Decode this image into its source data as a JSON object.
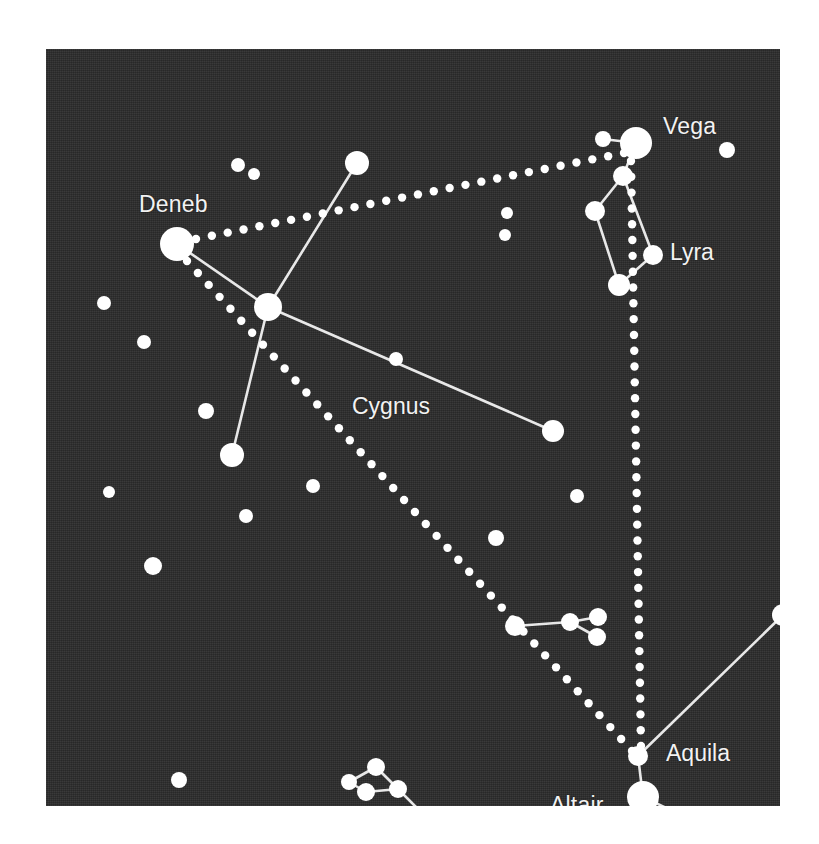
{
  "chart_data": {
    "type": "scatter",
    "xlabel": "",
    "ylabel": "",
    "xlim": [
      0,
      734
    ],
    "ylim": [
      0,
      757
    ],
    "grid": false,
    "legend": "none",
    "background_color": "#2c2c2c",
    "star_color": "#ffffff",
    "line_color": "#e8e8e8",
    "label_color": "#f2f2f2",
    "labels": [
      {
        "id": "label-vega",
        "text": "Vega",
        "x": 617,
        "y": 66,
        "kind": "star"
      },
      {
        "id": "label-deneb",
        "text": "Deneb",
        "x": 93,
        "y": 144,
        "kind": "star"
      },
      {
        "id": "label-lyra",
        "text": "Lyra",
        "x": 624,
        "y": 192,
        "kind": "constellation"
      },
      {
        "id": "label-cygnus",
        "text": "Cygnus",
        "x": 306,
        "y": 346,
        "kind": "constellation"
      },
      {
        "id": "label-aquila",
        "text": "Aquila",
        "x": 620,
        "y": 693,
        "kind": "constellation"
      },
      {
        "id": "label-altair",
        "text": "Altair",
        "x": 504,
        "y": 745,
        "kind": "star"
      }
    ],
    "stars": [
      {
        "name": "vega",
        "x": 590,
        "y": 94,
        "r": 16
      },
      {
        "name": "vega-companion-epsilon",
        "x": 557,
        "y": 90,
        "r": 8
      },
      {
        "name": "lyra-zeta",
        "x": 577,
        "y": 127,
        "r": 10
      },
      {
        "name": "lyra-delta",
        "x": 549,
        "y": 162,
        "r": 10
      },
      {
        "name": "lyra-gamma",
        "x": 607,
        "y": 206,
        "r": 10
      },
      {
        "name": "lyra-beta",
        "x": 573,
        "y": 236,
        "r": 11
      },
      {
        "name": "star-upper-right-edge",
        "x": 681,
        "y": 101,
        "r": 8
      },
      {
        "name": "deneb",
        "x": 131,
        "y": 195,
        "r": 17
      },
      {
        "name": "cygnus-sadr",
        "x": 222,
        "y": 258,
        "r": 14
      },
      {
        "name": "cygnus-delta",
        "x": 311,
        "y": 114,
        "r": 12
      },
      {
        "name": "cygnus-epsilon",
        "x": 507,
        "y": 382,
        "r": 11
      },
      {
        "name": "cygnus-albireo",
        "x": 186,
        "y": 406,
        "r": 12
      },
      {
        "name": "star-top-a",
        "x": 192,
        "y": 116,
        "r": 7
      },
      {
        "name": "star-top-b",
        "x": 208,
        "y": 125,
        "r": 6
      },
      {
        "name": "star-mid-top-a",
        "x": 461,
        "y": 164,
        "r": 6
      },
      {
        "name": "star-mid-top-b",
        "x": 459,
        "y": 186,
        "r": 6
      },
      {
        "name": "star-cygnus-field",
        "x": 350,
        "y": 310,
        "r": 7
      },
      {
        "name": "star-left-edge-a",
        "x": 58,
        "y": 254,
        "r": 7
      },
      {
        "name": "star-left-edge-b",
        "x": 98,
        "y": 293,
        "r": 7
      },
      {
        "name": "star-left-edge-c",
        "x": 160,
        "y": 362,
        "r": 8
      },
      {
        "name": "star-left-edge-d",
        "x": 63,
        "y": 443,
        "r": 6
      },
      {
        "name": "star-left-edge-e",
        "x": 107,
        "y": 517,
        "r": 9
      },
      {
        "name": "star-left-mid",
        "x": 200,
        "y": 467,
        "r": 7
      },
      {
        "name": "star-center-field-a",
        "x": 267,
        "y": 437,
        "r": 7
      },
      {
        "name": "star-center-field-b",
        "x": 450,
        "y": 489,
        "r": 8
      },
      {
        "name": "star-center-field-c",
        "x": 531,
        "y": 447,
        "r": 7
      },
      {
        "name": "star-right-field-a",
        "x": 751,
        "y": 414,
        "r": 9
      },
      {
        "name": "star-right-field-b",
        "x": 771,
        "y": 458,
        "r": 9
      },
      {
        "name": "star-right-field-c",
        "x": 745,
        "y": 537,
        "r": 5
      },
      {
        "name": "aquila-wing-tip",
        "x": 737,
        "y": 566,
        "r": 11
      },
      {
        "name": "sagitta-a",
        "x": 469,
        "y": 577,
        "r": 10
      },
      {
        "name": "sagitta-b",
        "x": 524,
        "y": 573,
        "r": 9
      },
      {
        "name": "sagitta-c",
        "x": 552,
        "y": 568,
        "r": 9
      },
      {
        "name": "sagitta-d",
        "x": 551,
        "y": 588,
        "r": 9
      },
      {
        "name": "altair",
        "x": 597,
        "y": 748,
        "r": 16
      },
      {
        "name": "aquila-tarazed",
        "x": 592,
        "y": 707,
        "r": 10
      },
      {
        "name": "aquila-alshain",
        "x": 591,
        "y": 796,
        "r": 9
      },
      {
        "name": "star-bottom-left",
        "x": 133,
        "y": 731,
        "r": 8
      },
      {
        "name": "delphinus-a",
        "x": 303,
        "y": 733,
        "r": 8
      },
      {
        "name": "delphinus-b",
        "x": 330,
        "y": 718,
        "r": 9
      },
      {
        "name": "delphinus-c",
        "x": 320,
        "y": 743,
        "r": 9
      },
      {
        "name": "delphinus-d",
        "x": 352,
        "y": 740,
        "r": 9
      },
      {
        "name": "delphinus-tail",
        "x": 400,
        "y": 788,
        "r": 9
      }
    ],
    "solid_lines": [
      {
        "name": "cygnus-deneb-sadr",
        "x1": 131,
        "y1": 195,
        "x2": 222,
        "y2": 258
      },
      {
        "name": "cygnus-sadr-delta",
        "x1": 222,
        "y1": 258,
        "x2": 311,
        "y2": 114
      },
      {
        "name": "cygnus-sadr-epsilon",
        "x1": 222,
        "y1": 258,
        "x2": 507,
        "y2": 382
      },
      {
        "name": "cygnus-sadr-albireo",
        "x1": 222,
        "y1": 258,
        "x2": 186,
        "y2": 406
      },
      {
        "name": "lyra-vega-epsilon",
        "x1": 590,
        "y1": 94,
        "x2": 557,
        "y2": 90
      },
      {
        "name": "lyra-vega-zeta",
        "x1": 590,
        "y1": 94,
        "x2": 577,
        "y2": 127
      },
      {
        "name": "lyra-zeta-delta",
        "x1": 577,
        "y1": 127,
        "x2": 549,
        "y2": 162
      },
      {
        "name": "lyra-zeta-gamma",
        "x1": 577,
        "y1": 127,
        "x2": 607,
        "y2": 206
      },
      {
        "name": "lyra-delta-beta",
        "x1": 549,
        "y1": 162,
        "x2": 573,
        "y2": 236
      },
      {
        "name": "lyra-beta-gamma",
        "x1": 573,
        "y1": 236,
        "x2": 607,
        "y2": 206
      },
      {
        "name": "sagitta-shaft",
        "x1": 469,
        "y1": 577,
        "x2": 524,
        "y2": 573
      },
      {
        "name": "sagitta-barb-upper",
        "x1": 524,
        "y1": 573,
        "x2": 552,
        "y2": 568
      },
      {
        "name": "sagitta-barb-lower",
        "x1": 524,
        "y1": 573,
        "x2": 551,
        "y2": 588
      },
      {
        "name": "aquila-altair-tarazed",
        "x1": 597,
        "y1": 748,
        "x2": 592,
        "y2": 707
      },
      {
        "name": "aquila-altair-alshain",
        "x1": 597,
        "y1": 748,
        "x2": 591,
        "y2": 796
      },
      {
        "name": "aquila-tarazed-wing",
        "x1": 592,
        "y1": 707,
        "x2": 737,
        "y2": 566
      },
      {
        "name": "aquila-altair-lower-wing",
        "x1": 597,
        "y1": 748,
        "x2": 760,
        "y2": 825
      },
      {
        "name": "delphinus-a-b",
        "x1": 303,
        "y1": 733,
        "x2": 330,
        "y2": 718
      },
      {
        "name": "delphinus-a-c",
        "x1": 303,
        "y1": 733,
        "x2": 320,
        "y2": 743
      },
      {
        "name": "delphinus-b-d",
        "x1": 330,
        "y1": 718,
        "x2": 352,
        "y2": 740
      },
      {
        "name": "delphinus-c-d",
        "x1": 320,
        "y1": 743,
        "x2": 352,
        "y2": 740
      },
      {
        "name": "delphinus-d-tail",
        "x1": 352,
        "y1": 740,
        "x2": 400,
        "y2": 788
      }
    ],
    "dotted_lines": [
      {
        "name": "triangle-deneb-vega",
        "x1": 150,
        "y1": 190,
        "x2": 578,
        "y2": 104,
        "dot_r": 4.2,
        "spacing": 16
      },
      {
        "name": "triangle-vega-altair",
        "x1": 585,
        "y1": 112,
        "x2": 595,
        "y2": 697,
        "dot_r": 4.2,
        "spacing": 16
      },
      {
        "name": "triangle-altair-deneb",
        "x1": 586,
        "y1": 702,
        "x2": 141,
        "y2": 212,
        "dot_r": 4.2,
        "spacing": 16
      }
    ]
  }
}
